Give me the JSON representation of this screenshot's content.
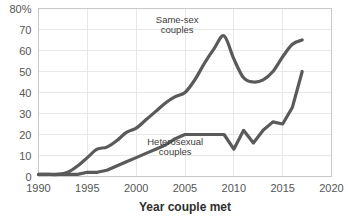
{
  "chart_data": {
    "type": "line",
    "title": "",
    "subtitle": "",
    "xlabel": "Year couple met",
    "ylabel": "",
    "xlim": [
      1990,
      2020
    ],
    "ylim": [
      0,
      80
    ],
    "grid": true,
    "legend_position": "inline-annotations",
    "xticks": [
      1990,
      1995,
      2000,
      2005,
      2010,
      2015,
      2020
    ],
    "xtick_labels": [
      "1990",
      "1995",
      "2000",
      "2005",
      "2010",
      "2015",
      "2020"
    ],
    "yticks": [
      0,
      10,
      20,
      30,
      40,
      50,
      60,
      70,
      80
    ],
    "ytick_labels": [
      "0",
      "10",
      "20",
      "30",
      "40",
      "50",
      "60",
      "70",
      "80%"
    ],
    "line_color": "#5a5a5a",
    "grid_color": "#e8e8e8",
    "frame_color": "#c9c9c9",
    "series": [
      {
        "name": "Same-sex couples",
        "annotation": "Same-sex\ncouples",
        "annotation_line1": "Same-sex",
        "annotation_line2": "couples",
        "x": [
          1990,
          1991,
          1992,
          1993,
          1994,
          1995,
          1996,
          1997,
          1998,
          1999,
          2000,
          2001,
          2002,
          2003,
          2004,
          2005,
          2006,
          2007,
          2008,
          2009,
          2010,
          2011,
          2012,
          2013,
          2014,
          2015,
          2016,
          2017
        ],
        "values": [
          1,
          1,
          1,
          2,
          5,
          9,
          13,
          14,
          17,
          21,
          23,
          27,
          31,
          35,
          38,
          40,
          46,
          54,
          61,
          67,
          56,
          47,
          45,
          46,
          50,
          57,
          63,
          65
        ]
      },
      {
        "name": "Heterosexual couples",
        "annotation": "Heterosexual\ncouples",
        "annotation_line1": "Heterosexual",
        "annotation_line2": "couples",
        "x": [
          1990,
          1991,
          1992,
          1993,
          1994,
          1995,
          1996,
          1997,
          1998,
          1999,
          2000,
          2001,
          2002,
          2003,
          2004,
          2005,
          2006,
          2007,
          2008,
          2009,
          2010,
          2011,
          2012,
          2013,
          2014,
          2015,
          2016,
          2017
        ],
        "values": [
          1,
          1,
          1,
          1,
          1,
          2,
          2,
          3,
          5,
          7,
          9,
          11,
          13,
          15,
          18,
          20,
          20,
          20,
          20,
          20,
          13,
          22,
          16,
          22,
          26,
          25,
          33,
          50
        ]
      }
    ],
    "annotations": [
      {
        "text_line1": "Same-sex",
        "text_line2": "couples",
        "x": 2004.2,
        "y": 73
      },
      {
        "text_line1": "Heterosexual",
        "text_line2": "couples",
        "x": 2004.0,
        "y": 15
      }
    ]
  }
}
